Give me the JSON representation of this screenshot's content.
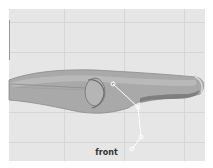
{
  "viewport": {
    "camera_label": "front",
    "background": "#e6e6e6",
    "grid_color": "#d6d6d6",
    "mesh_color": "#a8a8a8",
    "joint_color": "#ffffff"
  }
}
